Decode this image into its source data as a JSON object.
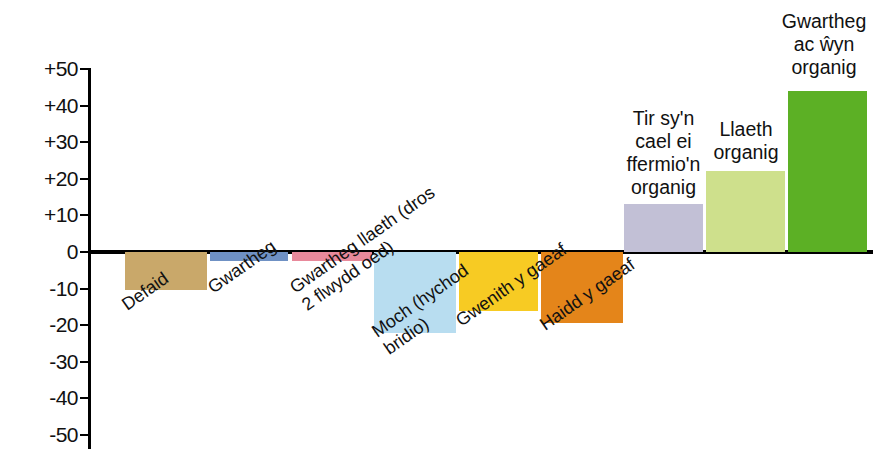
{
  "chart_data": {
    "type": "bar",
    "title": "",
    "subtitle": "",
    "xlabel": "",
    "ylabel": "",
    "ylim": [
      -50,
      50
    ],
    "grid": false,
    "legend": "none",
    "orientation": "vertical",
    "zero_baseline": true,
    "value_unit": "percent",
    "tick_labels": [
      "+50",
      "+40",
      "+30",
      "+20",
      "+10",
      "0",
      "-10",
      "-20",
      "-30",
      "-40",
      "-50"
    ],
    "tick_values": [
      50,
      40,
      30,
      20,
      10,
      0,
      -10,
      -20,
      -30,
      -40,
      -50
    ],
    "categories": [
      "Defaid",
      "Gwartheg",
      "Gwartheg llaeth (dros\n2 flwydd oed)",
      "Moch (hychod\nbridio)",
      "Gwenith y gaeaf",
      "Haidd y gaeaf",
      "Tir sy'n\ncael ei\nffermio'n\norganig",
      "Llaeth\norganig",
      "Gwartheg\nac ŵyn\norganig"
    ],
    "values": [
      -10.5,
      -2.5,
      -2.5,
      -22,
      -16,
      -19.5,
      13,
      22,
      44
    ],
    "colors": [
      "#c9a86a",
      "#6f91c4",
      "#e8899b",
      "#b8ddf0",
      "#f7cb23",
      "#e4851a",
      "#c2c0d6",
      "#cee08c",
      "#5cb025"
    ],
    "bars": [
      {
        "label": "Defaid",
        "value": -10.5,
        "color": "#c9a86a",
        "label_position": "below"
      },
      {
        "label": "Gwartheg",
        "value": -2.5,
        "color": "#6f91c4",
        "label_position": "below"
      },
      {
        "label": "Gwartheg llaeth (dros\n2 flwydd oed)",
        "value": -2.5,
        "color": "#e8899b",
        "label_position": "below"
      },
      {
        "label": "Moch (hychod\nbridio)",
        "value": -22,
        "color": "#b8ddf0",
        "label_position": "below"
      },
      {
        "label": "Gwenith y gaeaf",
        "value": -16,
        "color": "#f7cb23",
        "label_position": "below"
      },
      {
        "label": "Haidd y gaeaf",
        "value": -19.5,
        "color": "#e4851a",
        "label_position": "below"
      },
      {
        "label": "Tir sy'n\ncael ei\nffermio'n\norganig",
        "value": 13,
        "color": "#c2c0d6",
        "label_position": "above"
      },
      {
        "label": "Llaeth\norganig",
        "value": 22,
        "color": "#cee08c",
        "label_position": "above"
      },
      {
        "label": "Gwartheg\nac ŵyn\norganig",
        "value": 44,
        "color": "#5cb025",
        "label_position": "above"
      }
    ]
  },
  "axis": {
    "ticks": [
      {
        "label": "+50",
        "value": 50
      },
      {
        "label": "+40",
        "value": 40
      },
      {
        "label": "+30",
        "value": 30
      },
      {
        "label": "+20",
        "value": 20
      },
      {
        "label": "+10",
        "value": 10
      },
      {
        "label": "0",
        "value": 0
      },
      {
        "label": "-10",
        "value": -10
      },
      {
        "label": "-20",
        "value": -20
      },
      {
        "label": "-30",
        "value": -30
      },
      {
        "label": "-40",
        "value": -40
      },
      {
        "label": "-50",
        "value": -50
      }
    ]
  },
  "colors": {
    "axis": "#000000",
    "baseline": "#000000",
    "text": "#111111",
    "background": "#ffffff"
  }
}
